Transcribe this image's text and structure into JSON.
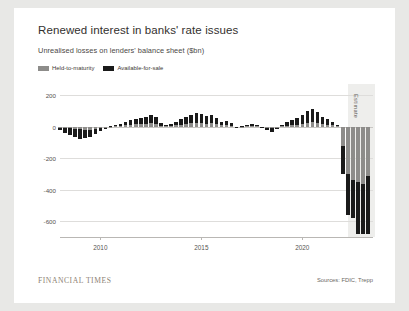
{
  "card": {
    "title": "Renewed interest in banks' rate issues",
    "subtitle": "Unrealised losses on lenders' balance sheet ($bn)",
    "footer_brand": "FINANCIAL TIMES",
    "sources": "Sources: FDIC, Trepp"
  },
  "colors": {
    "background": "#e8e8e6",
    "card": "#ffffff",
    "held_to_maturity": "#8d8c8a",
    "available_for_sale": "#1a1a1a",
    "gridline": "#dedddb",
    "estimate_band": "#eeeeec",
    "title_text": "#33302e"
  },
  "chart_data": {
    "type": "bar",
    "title": "Renewed interest in banks' rate issues",
    "subtitle": "Unrealised losses on lenders' balance sheet ($bn)",
    "xlabel": "",
    "ylabel": "$bn",
    "ylim": [
      -700,
      260
    ],
    "yticks": [
      200,
      0,
      -200,
      -400,
      -600
    ],
    "ytick_labels": [
      "200",
      "0",
      "-200",
      "-400",
      "-600"
    ],
    "xticks": [
      2010,
      2015,
      2020
    ],
    "xtick_labels": [
      "2010",
      "2015",
      "2020"
    ],
    "grid": true,
    "legend_position": "top-left",
    "stacked": true,
    "annotation": "Estimate",
    "annotation_start_x": 2022.25,
    "x_start": 2008.0,
    "x_end": 2023.5,
    "x": [
      2008.0,
      2008.25,
      2008.5,
      2008.75,
      2009.0,
      2009.25,
      2009.5,
      2009.75,
      2010.0,
      2010.25,
      2010.5,
      2010.75,
      2011.0,
      2011.25,
      2011.5,
      2011.75,
      2012.0,
      2012.25,
      2012.5,
      2012.75,
      2013.0,
      2013.25,
      2013.5,
      2013.75,
      2014.0,
      2014.25,
      2014.5,
      2014.75,
      2015.0,
      2015.25,
      2015.5,
      2015.75,
      2016.0,
      2016.25,
      2016.5,
      2016.75,
      2017.0,
      2017.25,
      2017.5,
      2017.75,
      2018.0,
      2018.25,
      2018.5,
      2018.75,
      2019.0,
      2019.25,
      2019.5,
      2019.75,
      2020.0,
      2020.25,
      2020.5,
      2020.75,
      2021.0,
      2021.25,
      2021.5,
      2021.75,
      2022.0,
      2022.25,
      2022.5,
      2022.75,
      2023.0,
      2023.25
    ],
    "series": [
      {
        "name": "Held-to-maturity",
        "color": "#8d8c8a",
        "values": [
          -4,
          -8,
          -10,
          -12,
          -14,
          -18,
          -20,
          -16,
          -10,
          -5,
          2,
          4,
          6,
          10,
          14,
          16,
          18,
          20,
          22,
          18,
          8,
          4,
          6,
          10,
          14,
          18,
          22,
          24,
          22,
          20,
          22,
          16,
          10,
          12,
          8,
          -2,
          2,
          4,
          6,
          4,
          -2,
          -6,
          -8,
          -4,
          4,
          8,
          12,
          14,
          20,
          26,
          28,
          24,
          18,
          14,
          10,
          4,
          -120,
          -300,
          -340,
          -350,
          -360,
          -310
        ]
      },
      {
        "name": "Available-for-sale",
        "color": "#1a1a1a",
        "values": [
          -16,
          -30,
          -44,
          -52,
          -60,
          -54,
          -42,
          -30,
          -14,
          -4,
          6,
          10,
          14,
          22,
          30,
          34,
          40,
          46,
          52,
          46,
          18,
          8,
          14,
          22,
          34,
          44,
          54,
          62,
          58,
          52,
          56,
          40,
          24,
          28,
          18,
          -6,
          6,
          10,
          14,
          10,
          -8,
          -16,
          -22,
          -12,
          10,
          22,
          34,
          40,
          56,
          78,
          86,
          70,
          46,
          34,
          24,
          8,
          -180,
          -260,
          -240,
          -330,
          -320,
          -370
        ]
      }
    ]
  },
  "legend": {
    "items": [
      {
        "label": "Held-to-maturity",
        "color": "#8d8c8a"
      },
      {
        "label": "Available-for-sale",
        "color": "#1a1a1a"
      }
    ]
  }
}
